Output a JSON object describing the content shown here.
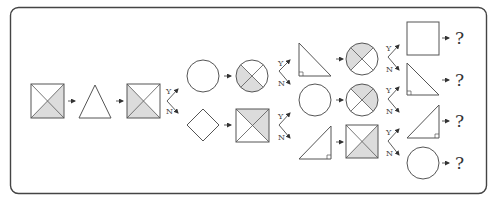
{
  "diagram": {
    "type": "decision-flow of shapes",
    "branch_labels": {
      "yes": "Y",
      "no": "N"
    },
    "question_mark": "?",
    "colors": {
      "stroke": "#555555",
      "shade": "#dcdcdc",
      "frame": "#444444"
    },
    "stage1": {
      "shapes": [
        {
          "id": "s1",
          "shape": "square-x",
          "shaded": [
            "right",
            "bottom"
          ]
        },
        {
          "id": "s2",
          "shape": "triangle"
        },
        {
          "id": "s3",
          "shape": "square-x",
          "shaded": [
            "left",
            "bottom"
          ]
        }
      ]
    },
    "stage2": {
      "yes_branch": [
        {
          "id": "a1",
          "shape": "circle"
        },
        {
          "id": "a2",
          "shape": "circle-x",
          "shaded": [
            "left",
            "bottom"
          ]
        }
      ],
      "no_branch": [
        {
          "id": "b1",
          "shape": "diamond"
        },
        {
          "id": "b2",
          "shape": "square-x",
          "shaded": [
            "top",
            "right"
          ]
        }
      ]
    },
    "stage3": [
      {
        "id": "c1",
        "shape": "right-triangle-left",
        "next": {
          "shape": "circle-x",
          "shaded": [
            "top",
            "left"
          ]
        }
      },
      {
        "id": "c2",
        "shape": "circle",
        "next": {
          "shape": "circle-x",
          "shaded": [
            "top",
            "right"
          ]
        }
      },
      {
        "id": "c3",
        "shape": "right-triangle-right",
        "next": {
          "shape": "square-x",
          "shaded": [
            "right",
            "bottom"
          ]
        }
      }
    ],
    "outcomes": [
      {
        "id": "o1",
        "shape": "square",
        "result": "?"
      },
      {
        "id": "o2",
        "shape": "right-triangle-left",
        "result": "?"
      },
      {
        "id": "o3",
        "shape": "right-triangle-right",
        "result": "?"
      },
      {
        "id": "o4",
        "shape": "circle",
        "result": "?"
      }
    ]
  }
}
